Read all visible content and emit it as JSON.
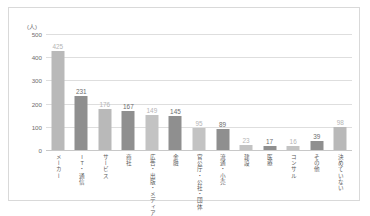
{
  "chart_data": {
    "type": "bar",
    "title": "",
    "xlabel": "",
    "ylabel": "(人)",
    "unit_label": "(人)",
    "categories": [
      "メーカー",
      "IT・通信",
      "サービス",
      "商社",
      "広告・出版・メディア",
      "金融",
      "官公庁・公社・団体",
      "流通・小売",
      "建設",
      "医療",
      "コンサル",
      "その他",
      "決めていない"
    ],
    "values": [
      425,
      231,
      176,
      167,
      149,
      145,
      95,
      89,
      23,
      17,
      16,
      39,
      98
    ],
    "ylim": [
      0,
      500
    ],
    "yticks": [
      0,
      100,
      200,
      300,
      400,
      500
    ],
    "ytick_labels": [
      "0",
      "100",
      "200",
      "300",
      "400",
      "500"
    ],
    "grid": true,
    "legend": "none",
    "bar_colors": [
      "#b9b9b9",
      "#8f8f8f",
      "#b9b9b9",
      "#8f8f8f",
      "#c3c3c3",
      "#8f8f8f",
      "#c3c3c3",
      "#8f8f8f",
      "#c3c3c3",
      "#8f8f8f",
      "#c3c3c3",
      "#8f8f8f",
      "#b9b9b9"
    ],
    "value_label_colors": [
      "#b5b5b5",
      "#6e6e6e",
      "#b5b5b5",
      "#6e6e6e",
      "#b5b5b5",
      "#6e6e6e",
      "#b5b5b5",
      "#6e6e6e",
      "#b5b5b5",
      "#6e6e6e",
      "#b5b5b5",
      "#6e6e6e",
      "#b5b5b5"
    ]
  }
}
